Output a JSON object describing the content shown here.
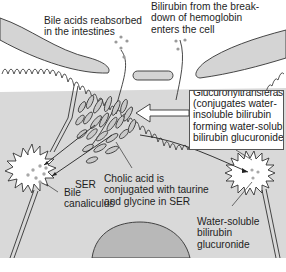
{
  "diagram": {
    "type": "hepatocyte bile and bilirubin processing illustration",
    "colors": {
      "background": "#ffffff",
      "cytoplasm": "#d9d9d9",
      "sinusoid_cells": "#d4d4d4",
      "nucleus": "#b5b5b5",
      "canaliculus": "#ffffff",
      "outline": "#333333",
      "dots": "#a8a8a8"
    }
  },
  "labels": {
    "bile_acids": "Bile acids reabsorbed\nin the intestines",
    "bilirubin_entry": "Bilirubin from the break-\ndown of hemoglobin\nenters the cell",
    "ser": "SER",
    "cholic_acid": "Cholic acid is\nconjugated with taurine\nand glycine in SER",
    "bile_canaliculus": "Bile\ncanaliculus",
    "water_soluble": "Water-soluble\nbilirubin\nglucuronide"
  },
  "enzyme_box": {
    "title_clipped": "Glucuronyltransferase",
    "lines": [
      "(conjugates water-",
      "insoluble bilirubin",
      "forming water-soluble",
      "bilirubin glucuronide)"
    ]
  }
}
